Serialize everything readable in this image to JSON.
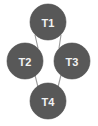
{
  "diagram": {
    "title": "",
    "type": "graph-diamond",
    "background_color": "#ffffff",
    "node_fill_color": "#585858",
    "node_label_color": "#f2f2f2",
    "edge_color": "#9a9a9a",
    "nodes": [
      {
        "id": "T1",
        "label": "T1",
        "cx": 48,
        "cy": 22,
        "r": 18
      },
      {
        "id": "T2",
        "label": "T2",
        "cx": 25,
        "cy": 61,
        "r": 18
      },
      {
        "id": "T3",
        "label": "T3",
        "cx": 72,
        "cy": 61,
        "r": 18
      },
      {
        "id": "T4",
        "label": "T4",
        "cx": 48,
        "cy": 101,
        "r": 18
      }
    ],
    "edges": [
      {
        "from": "T1",
        "to": "T2",
        "x1": 35,
        "y1": 35,
        "x2": 38,
        "y2": 48
      },
      {
        "from": "T1",
        "to": "T3",
        "x1": 61,
        "y1": 35,
        "x2": 59,
        "y2": 48
      },
      {
        "from": "T2",
        "to": "T4",
        "x1": 35,
        "y1": 75,
        "x2": 38,
        "y2": 87
      },
      {
        "from": "T3",
        "to": "T4",
        "x1": 61,
        "y1": 75,
        "x2": 58,
        "y2": 87
      }
    ]
  }
}
